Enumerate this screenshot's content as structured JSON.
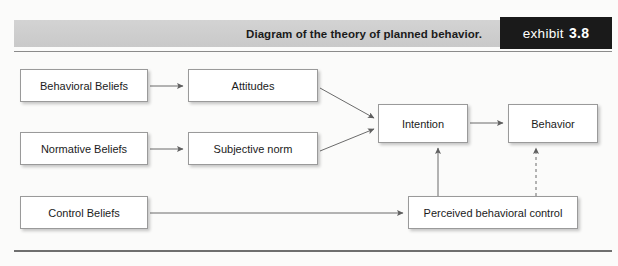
{
  "header": {
    "title": "Diagram of the theory of planned behavior.",
    "exhibit_word": "exhibit",
    "exhibit_number": "3.8"
  },
  "colors": {
    "header_bar": "#d0d0d0",
    "exhibit_box": "#1a1a1a",
    "box_border": "#9a9a9a",
    "box_fill": "#ffffff",
    "connector": "#6b6b6b",
    "page_background": "#fbfbfa"
  },
  "diagram": {
    "type": "flowchart",
    "nodes": [
      {
        "id": "behavioral_beliefs",
        "label": "Behavioral Beliefs"
      },
      {
        "id": "normative_beliefs",
        "label": "Normative Beliefs"
      },
      {
        "id": "control_beliefs",
        "label": "Control Beliefs"
      },
      {
        "id": "attitudes",
        "label": "Attitudes"
      },
      {
        "id": "subjective_norm",
        "label": "Subjective norm"
      },
      {
        "id": "intention",
        "label": "Intention"
      },
      {
        "id": "behavior",
        "label": "Behavior"
      },
      {
        "id": "perceived_control",
        "label": "Perceived behavioral control"
      }
    ],
    "edges": [
      {
        "from": "behavioral_beliefs",
        "to": "attitudes",
        "style": "solid"
      },
      {
        "from": "normative_beliefs",
        "to": "subjective_norm",
        "style": "solid"
      },
      {
        "from": "control_beliefs",
        "to": "perceived_control",
        "style": "solid"
      },
      {
        "from": "attitudes",
        "to": "intention",
        "style": "solid"
      },
      {
        "from": "subjective_norm",
        "to": "intention",
        "style": "solid"
      },
      {
        "from": "perceived_control",
        "to": "intention",
        "style": "solid"
      },
      {
        "from": "perceived_control",
        "to": "behavior",
        "style": "dashed"
      },
      {
        "from": "intention",
        "to": "behavior",
        "style": "solid"
      }
    ]
  }
}
